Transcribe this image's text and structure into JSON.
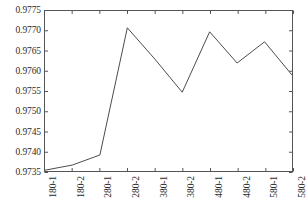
{
  "chart_data": {
    "type": "line",
    "title": "",
    "xlabel": "",
    "ylabel": "",
    "categories": [
      "180-1",
      "180-2",
      "280-1",
      "280-2",
      "380-1",
      "380-2",
      "480-1",
      "480-2",
      "580-1",
      "580-2"
    ],
    "values": [
      0.97352,
      0.97365,
      0.9739,
      0.97708,
      0.9763,
      0.97547,
      0.97698,
      0.9762,
      0.97673,
      0.9759
    ],
    "ylim": [
      0.9735,
      0.9775
    ],
    "yticks": [
      0.9735,
      0.974,
      0.9745,
      0.975,
      0.9755,
      0.976,
      0.9765,
      0.977,
      0.9775
    ],
    "ytick_labels": [
      "0.9735",
      "0.9740",
      "0.9745",
      "0.9750",
      "0.9755",
      "0.9760",
      "0.9765",
      "0.9770",
      "0.9775"
    ],
    "xtick_labels": [
      "180-1",
      "180-2",
      "280-1",
      "280-2",
      "380-1",
      "380-2",
      "480-1",
      "480-2",
      "580-1",
      "580-2"
    ],
    "grid": false,
    "legend": null,
    "legend_position": "none",
    "series_color": "#4a4a4a",
    "axis_color": "#555555",
    "background_color": "#ffffff",
    "marker": "none",
    "line_width": 1
  },
  "figure": {
    "frame_left": 44,
    "frame_top": 10,
    "frame_width": 249,
    "frame_height": 162,
    "xtick_rotation_deg": -90
  }
}
